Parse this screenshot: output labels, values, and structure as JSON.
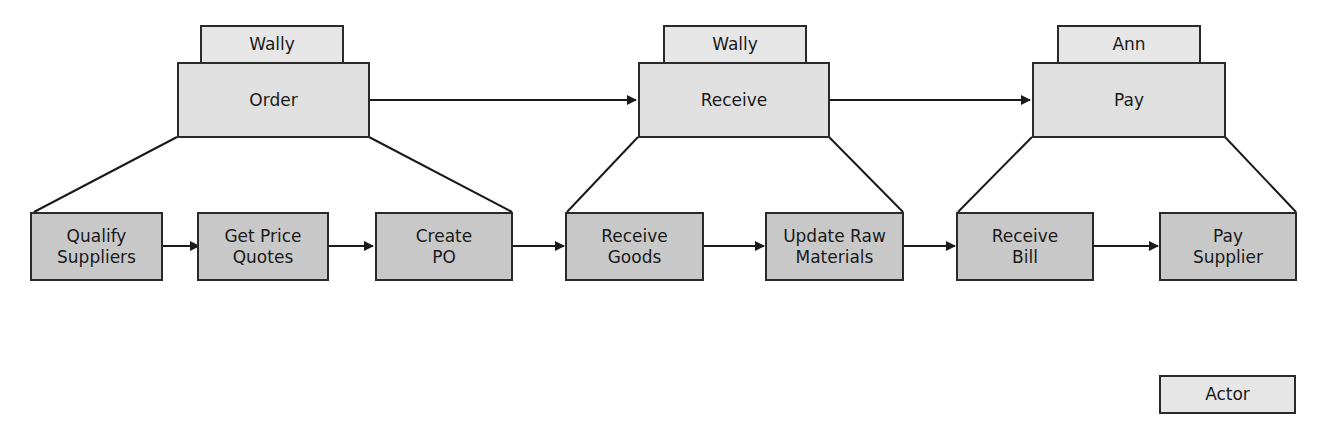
{
  "processes": [
    {
      "name": "Order",
      "actor": "Wally"
    },
    {
      "name": "Receive",
      "actor": "Wally"
    },
    {
      "name": "Pay",
      "actor": "Ann"
    }
  ],
  "subprocesses": [
    {
      "line1": "Qualify",
      "line2": "Suppliers",
      "parent": "Order"
    },
    {
      "line1": "Get Price",
      "line2": "Quotes",
      "parent": "Order"
    },
    {
      "line1": "Create",
      "line2": "PO",
      "parent": "Order"
    },
    {
      "line1": "Receive",
      "line2": "Goods",
      "parent": "Receive"
    },
    {
      "line1": "Update Raw",
      "line2": "Materials",
      "parent": "Receive"
    },
    {
      "line1": "Receive",
      "line2": "Bill",
      "parent": "Pay"
    },
    {
      "line1": "Pay",
      "line2": "Supplier",
      "parent": "Pay"
    }
  ],
  "legend": {
    "label": "Actor"
  },
  "colors": {
    "actor_fill": "#e6e6e6",
    "process_fill": "#e0e0e0",
    "subprocess_fill": "#c8c8c8",
    "stroke": "#2a2a2a"
  }
}
